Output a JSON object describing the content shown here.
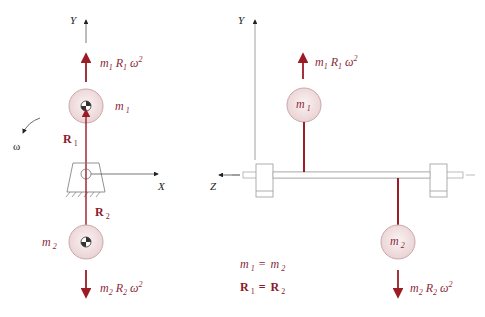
{
  "colors": {
    "force": "#9b1c24",
    "mass_fill": "#f3e3e4",
    "mass_stroke": "#c9a7aa",
    "label": "#8b2a3a",
    "axis": "#222222",
    "structure": "#999999"
  },
  "left_view": {
    "axis_y": "Y",
    "axis_x": "X",
    "omega": "ω",
    "force_top": {
      "m": "m",
      "m_sub": "1",
      "r": "R",
      "r_sub": "1",
      "w": "ω",
      "exp": "2"
    },
    "force_bottom": {
      "m": "m",
      "m_sub": "2",
      "r": "R",
      "r_sub": "2",
      "w": "ω",
      "exp": "2"
    },
    "mass_top": {
      "m": "m",
      "sub": "1"
    },
    "mass_bottom": {
      "m": "m",
      "sub": "2"
    },
    "radius_top": {
      "r": "R",
      "sub": "1"
    },
    "radius_bottom": {
      "r": "R",
      "sub": "2"
    }
  },
  "right_view": {
    "axis_y": "Y",
    "axis_z": "Z",
    "force_top": {
      "m": "m",
      "m_sub": "1",
      "r": "R",
      "r_sub": "1",
      "w": "ω",
      "exp": "2"
    },
    "force_bottom": {
      "m": "m",
      "m_sub": "2",
      "r": "R",
      "r_sub": "2",
      "w": "ω",
      "exp": "2"
    },
    "mass_top": {
      "m": "m",
      "sub": "1"
    },
    "mass_bottom": {
      "m": "m",
      "sub": "2"
    }
  },
  "equations": {
    "line1": {
      "a": "m",
      "a_sub": "1",
      "eq": "=",
      "b": "m",
      "b_sub": "2"
    },
    "line2": {
      "a": "R",
      "a_sub": "1",
      "eq": "=",
      "b": "R",
      "b_sub": "2"
    }
  }
}
